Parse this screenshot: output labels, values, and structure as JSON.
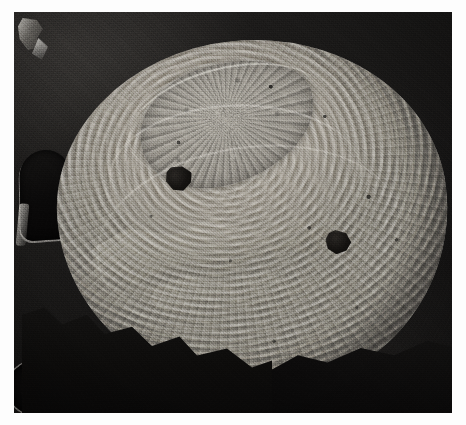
{
  "image": {
    "kind": "sem-micrograph",
    "title": "Scanning electron micrograph of a circular shell specimen",
    "caption": "",
    "frame": {
      "left_px": 14,
      "top_px": 12,
      "width_px": 438,
      "height_px": 401
    },
    "palette": {
      "background_dark": "#141312",
      "background_deepest": "#080707",
      "specimen_light": "#b9b5ac",
      "specimen_mid": "#97938b",
      "specimen_shadow": "#5e5c57",
      "highlight": "#f4f2ec",
      "page_white": "#fdfdfd"
    },
    "subject": {
      "name": "shell-specimen",
      "description": "Ovate, near-circular calcareous valve viewed from above, dominated by strong concentric growth lamellae radiating from an eroded apex in the upper-left quadrant.",
      "center_px": [
        239,
        204
      ],
      "width_px": 390,
      "height_px": 352,
      "rotation_deg": -6
    },
    "features": [
      {
        "name": "apex-umbo-patch",
        "description": "Rough granular eroded apex region near the top-left of the valve",
        "position_px": [
          235,
          120
        ]
      },
      {
        "name": "pit-upper-left",
        "description": "Dark angular puncture through the shell surface",
        "position_px": [
          169,
          159
        ],
        "size_px": [
          27,
          26
        ]
      },
      {
        "name": "pit-lower-right",
        "description": "Dark rounded puncture through the shell surface",
        "position_px": [
          320,
          240
        ],
        "size_px": [
          26,
          24
        ]
      },
      {
        "name": "growth-lamellae",
        "description": "Dense concentric ridges strongest along the right and lower margins"
      },
      {
        "name": "fracture-step",
        "description": "Stepped break exposing underlying shell layers across the mid-left"
      },
      {
        "name": "stub-hole-arch",
        "description": "Arched dark aperture in the mounting stub at the left edge",
        "position_px": [
          45,
          195
        ]
      },
      {
        "name": "stub-hole-round",
        "description": "Circular dark aperture in the mounting stub at the lower-left",
        "position_px": [
          22,
          388
        ]
      },
      {
        "name": "bright-debris-fleck",
        "description": "Small brightly charging debris particle at the upper-left corner",
        "position_px": [
          28,
          30
        ]
      },
      {
        "name": "shadow-wedge",
        "description": "Jagged dark shadow obscuring the lower-left margin of the valve"
      }
    ]
  }
}
